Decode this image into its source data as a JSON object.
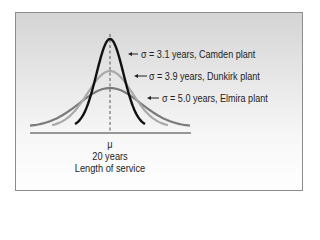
{
  "chart_data": {
    "type": "line",
    "title": "",
    "xlabel": "Length of service",
    "ylabel": "",
    "mean_symbol": "μ",
    "mean_label": "20 years",
    "mean_value": 20,
    "series": [
      {
        "name": "Camden plant",
        "sigma": 3.1,
        "label": "σ = 3.1 years, Camden plant",
        "color": "#111111"
      },
      {
        "name": "Dunkirk plant",
        "sigma": 3.9,
        "label": "σ = 3.9 years, Dunkirk plant",
        "color": "#a9a9a9"
      },
      {
        "name": "Elmira plant",
        "sigma": 5.0,
        "label": "σ = 5.0 years, Elmira plant",
        "color": "#7b7b7b"
      }
    ],
    "grid": false,
    "legend_position": "annotations-right"
  },
  "labels": {
    "camden": "σ = 3.1 years, Camden plant",
    "dunkirk": "σ = 3.9 years, Dunkirk plant",
    "elmira": "σ = 5.0 years, Elmira plant",
    "mu": "μ",
    "mean": "20 years",
    "axis": "Length of service"
  }
}
